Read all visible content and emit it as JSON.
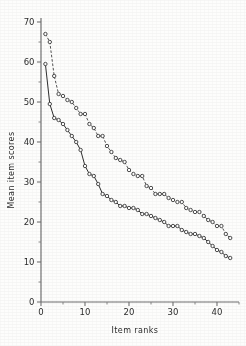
{
  "figure": {
    "background_color": "#fdfdfc",
    "ink_color": "#2e2e2e"
  },
  "chart_data": {
    "type": "line",
    "title": "",
    "subtitle": "",
    "xlabel": "Item ranks",
    "ylabel": "Mean item scores",
    "xlim": [
      0,
      45
    ],
    "ylim": [
      0,
      70
    ],
    "xticks": [
      0,
      10,
      20,
      30,
      40
    ],
    "yticks": [
      0,
      10,
      20,
      30,
      40,
      50,
      60,
      70
    ],
    "xtick_labels": [
      "0",
      "10",
      "20",
      "30",
      "40"
    ],
    "ytick_labels": [
      "0",
      "10",
      "20",
      "30",
      "40",
      "50",
      "60",
      "70"
    ],
    "x_minor_tick_step": 5,
    "y_minor_tick_step": 5,
    "grid": false,
    "legend": false,
    "legend_position": "none",
    "marker": "open-circle",
    "series": [
      {
        "name": "upper-series",
        "line_style": "dashed",
        "color": "#4a4a4a",
        "x": [
          1,
          2,
          3,
          4,
          5,
          6,
          7,
          8,
          9,
          10,
          11,
          12,
          13,
          14,
          15,
          16,
          17,
          18,
          19,
          20,
          21,
          22,
          23,
          24,
          25,
          26,
          27,
          28,
          29,
          30,
          31,
          32,
          33,
          34,
          35,
          36,
          37,
          38,
          39,
          40,
          41,
          42,
          43
        ],
        "values": [
          67.0,
          65.0,
          56.5,
          52.0,
          51.5,
          50.5,
          50.0,
          48.5,
          47.0,
          47.0,
          44.5,
          43.5,
          41.5,
          41.5,
          39.0,
          37.5,
          36.0,
          35.5,
          35.0,
          33.0,
          32.0,
          31.5,
          31.5,
          29.0,
          28.5,
          27.0,
          27.0,
          27.0,
          26.0,
          25.5,
          25.0,
          25.0,
          23.5,
          23.0,
          22.5,
          22.5,
          21.5,
          20.5,
          20.0,
          19.0,
          19.0,
          17.0,
          16.0
        ]
      },
      {
        "name": "lower-series",
        "line_style": "solid",
        "color": "#2e2e2e",
        "x": [
          1,
          2,
          3,
          4,
          5,
          6,
          7,
          8,
          9,
          10,
          11,
          12,
          13,
          14,
          15,
          16,
          17,
          18,
          19,
          20,
          21,
          22,
          23,
          24,
          25,
          26,
          27,
          28,
          29,
          30,
          31,
          32,
          33,
          34,
          35,
          36,
          37,
          38,
          39,
          40,
          41,
          42,
          43
        ],
        "values": [
          59.5,
          49.5,
          46.0,
          45.5,
          44.5,
          43.0,
          41.5,
          40.0,
          38.0,
          34.0,
          32.0,
          31.5,
          29.5,
          27.0,
          26.5,
          25.5,
          25.0,
          24.0,
          24.0,
          23.5,
          23.5,
          23.0,
          22.0,
          22.0,
          21.5,
          21.0,
          20.5,
          20.0,
          19.0,
          19.0,
          19.0,
          18.0,
          17.5,
          17.0,
          17.0,
          16.5,
          16.0,
          15.0,
          14.0,
          13.0,
          12.5,
          11.5,
          11.0
        ]
      }
    ]
  }
}
